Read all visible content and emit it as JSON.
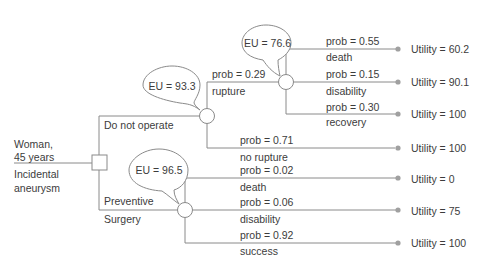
{
  "root": {
    "patient_line1": "Woman,",
    "patient_line2": "45 years",
    "condition_line1": "Incidental",
    "condition_line2": "aneurysm",
    "node_type": "decision-square"
  },
  "branches": {
    "no_op": {
      "label": "Do not operate",
      "eu": "EU = 93.3",
      "rupture": {
        "prob": "prob = 0.29",
        "label": "rupture",
        "eu": "EU = 76.6",
        "outcomes": [
          {
            "prob": "prob = 0.55",
            "label": "death",
            "utility": "Utility = 60.2"
          },
          {
            "prob": "prob = 0.15",
            "label": "disability",
            "utility": "Utility = 90.1"
          },
          {
            "prob": "prob = 0.30",
            "label": "recovery",
            "utility": "Utility = 100"
          }
        ]
      },
      "no_rupture": {
        "prob": "prob = 0.71",
        "label": "no rupture",
        "utility": "Utility = 100"
      }
    },
    "surgery": {
      "label_line1": "Preventive",
      "label_line2": "Surgery",
      "eu": "EU = 96.5",
      "outcomes": [
        {
          "prob": "prob = 0.02",
          "label": "death",
          "utility": "Utility = 0"
        },
        {
          "prob": "prob = 0.06",
          "label": "disability",
          "utility": "Utility = 75"
        },
        {
          "prob": "prob = 0.92",
          "label": "success",
          "utility": "Utility = 100"
        }
      ]
    }
  },
  "colors": {
    "line": "#8a8a8a",
    "terminal_dot": "#9a9a9a",
    "text": "#3c3c3c"
  }
}
